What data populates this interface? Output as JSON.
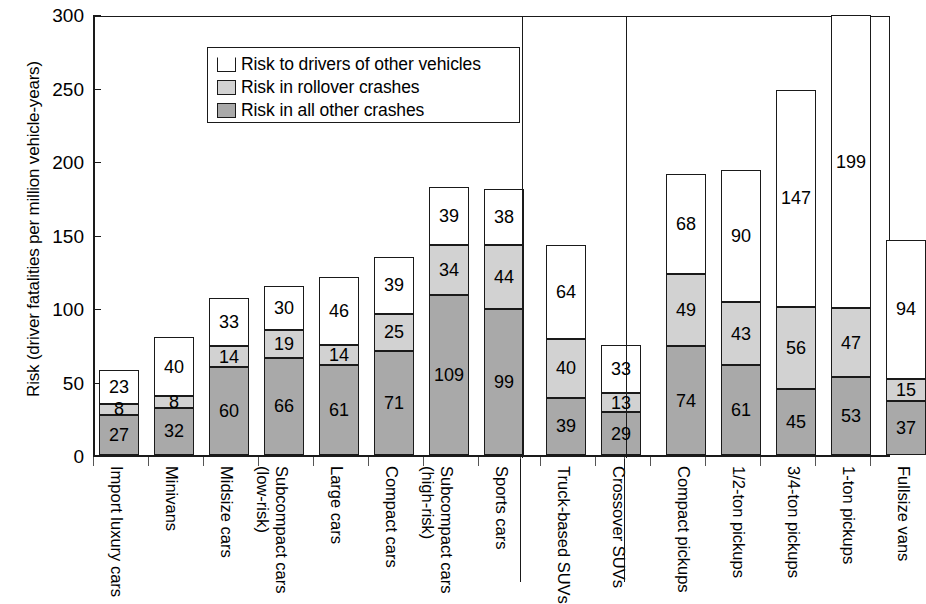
{
  "chart_data": {
    "type": "bar",
    "stacked": true,
    "title": "",
    "xlabel": "",
    "ylabel": "Risk (driver fatalities per million vehicle-years)",
    "ylim": [
      0,
      300
    ],
    "yticks": [
      0,
      50,
      100,
      150,
      200,
      250,
      300
    ],
    "ytick_labels": [
      "0",
      "50",
      "100",
      "150",
      "200",
      "250",
      "300"
    ],
    "grid": false,
    "legend_position": "upper-left-inside",
    "legend": [
      {
        "key": "other_drivers",
        "label": "Risk to drivers of other vehicles",
        "color": "#ffffff"
      },
      {
        "key": "rollover",
        "label": "Risk in rollover crashes",
        "color": "#d2d2d2"
      },
      {
        "key": "all_other",
        "label": "Risk in all other crashes",
        "color": "#a9a9a9"
      }
    ],
    "categories": [
      "Import luxury cars",
      "Minivans",
      "Midsize cars",
      "Subcompact cars (low-risk)",
      "Large cars",
      "Compact cars",
      "Subcompact cars (high-risk)",
      "Sports cars",
      "Truck-based SUVs",
      "Crossover SUVs",
      "Compact pickups",
      "1/2-ton pickups",
      "3/4-ton pickups",
      "1-ton pickups",
      "Fullsize vans"
    ],
    "category_lines": [
      [
        "Import luxury cars",
        ""
      ],
      [
        "Minivans",
        ""
      ],
      [
        "Midsize cars",
        ""
      ],
      [
        "Subcompact cars",
        "(low-risk)"
      ],
      [
        "Large cars",
        ""
      ],
      [
        "Compact cars",
        ""
      ],
      [
        "Subcompact cars",
        "(high-risk)"
      ],
      [
        "Sports cars",
        ""
      ],
      [
        "Truck-based SUVs",
        ""
      ],
      [
        "Crossover SUVs",
        ""
      ],
      [
        "Compact pickups",
        ""
      ],
      [
        "1/2-ton pickups",
        ""
      ],
      [
        "3/4-ton pickups",
        ""
      ],
      [
        "1-ton pickups",
        ""
      ],
      [
        "Fullsize vans",
        ""
      ]
    ],
    "series": [
      {
        "name": "Risk in all other crashes",
        "values": [
          27,
          32,
          60,
          66,
          61,
          71,
          109,
          99,
          39,
          29,
          74,
          61,
          45,
          53,
          37
        ]
      },
      {
        "name": "Risk in rollover crashes",
        "values": [
          8,
          8,
          14,
          19,
          14,
          25,
          34,
          44,
          40,
          13,
          49,
          43,
          56,
          47,
          15
        ]
      },
      {
        "name": "Risk to drivers of other vehicles",
        "values": [
          23,
          40,
          33,
          30,
          46,
          39,
          39,
          38,
          64,
          33,
          68,
          90,
          147,
          199,
          94
        ]
      }
    ],
    "totals": [
      58,
      80,
      107,
      115,
      121,
      135,
      182,
      181,
      143,
      75,
      191,
      194,
      248,
      299,
      146
    ],
    "groups": [
      {
        "name": "Cars",
        "start": 0,
        "end": 7
      },
      {
        "name": "SUVs",
        "start": 8,
        "end": 9
      },
      {
        "name": "Pickups and vans",
        "start": 10,
        "end": 14
      }
    ]
  }
}
